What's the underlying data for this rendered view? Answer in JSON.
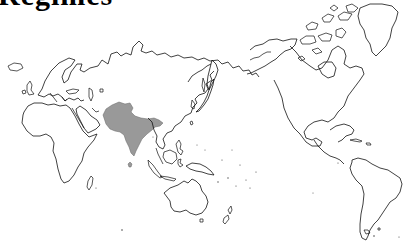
{
  "title": {
    "text": "Regimes",
    "note": "clipped at top edge; only lower portions of glyphs visible"
  },
  "map": {
    "projection": "world outline, Pacific-centered",
    "background": "#ffffff",
    "outline_color": "#111111",
    "highlight_color": "#999999",
    "highlighted_region": {
      "name": "South Asia",
      "countries": [
        "Afghanistan",
        "Pakistan",
        "India",
        "Nepal",
        "Bhutan",
        "Bangladesh",
        "Sri Lanka"
      ]
    },
    "landmasses": [
      "Europe",
      "Africa",
      "Asia",
      "Australia",
      "New Zealand",
      "North America",
      "Greenland",
      "South America"
    ]
  }
}
